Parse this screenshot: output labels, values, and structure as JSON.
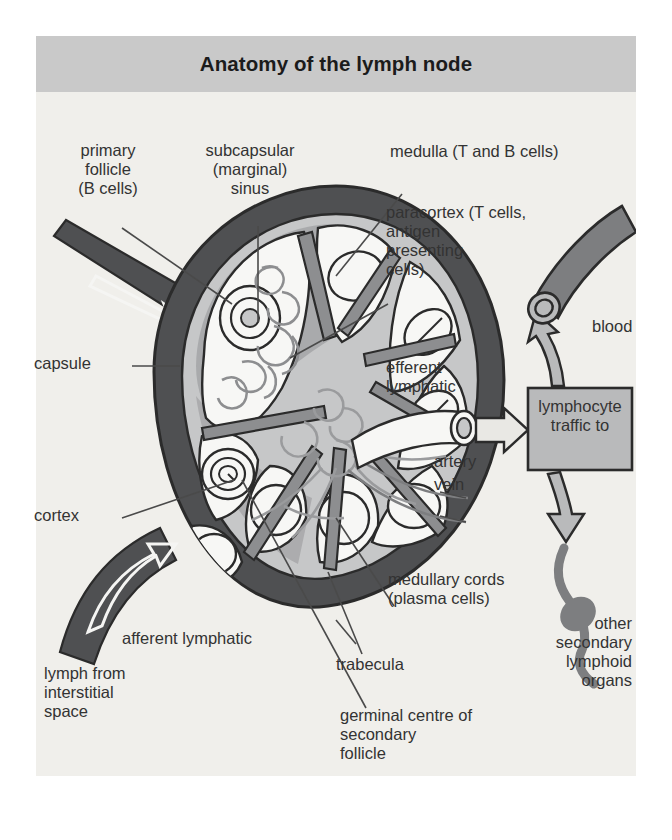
{
  "figure": {
    "title": "Anatomy of the lymph node",
    "background_color": "#f0efeb",
    "titlebar_color": "#c9c9c9",
    "ink_color": "#333333"
  },
  "palette": {
    "capsule_dark": "#4f5052",
    "cortex_mid": "#a8a9ab",
    "medulla_light": "#c6c7c8",
    "follicle_white": "#f7f7f5",
    "outline": "#2b2b2b",
    "box_fill": "#b9babb"
  },
  "labels": {
    "primary_follicle": "primary\nfollicle\n(B cells)",
    "subcapsular_sinus": "subcapsular\n(marginal)\nsinus",
    "medulla": "medulla (T and B cells)",
    "paracortex": "paracortex (T cells,\nantigen\npresenting\ncells)",
    "capsule": "capsule",
    "efferent_lymphatic": "efferent\nlymphatic",
    "blood": "blood",
    "lymphocyte_traffic": "lymphocyte\ntraffic to",
    "artery": "artery",
    "vein": "vein",
    "cortex": "cortex",
    "medullary_cords": "medullary cords\n(plasma cells)",
    "other_secondary": "other\nsecondary\nlymphoid\norgans",
    "afferent_lymphatic": "afferent lymphatic",
    "lymph_from_interstitial": "lymph from\ninterstitial\nspace",
    "trabecula": "trabecula",
    "germinal_centre": "germinal centre of\nsecondary\nfollicle"
  }
}
